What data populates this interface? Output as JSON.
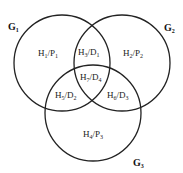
{
  "diagram": {
    "type": "venn-3",
    "stroke_color": "#222222",
    "sets": [
      {
        "id": "G1",
        "main": "G",
        "sub": "1",
        "cx": 62,
        "cy": 63,
        "r": 48,
        "label_x": 8,
        "label_y": 30
      },
      {
        "id": "G2",
        "main": "G",
        "sub": "2",
        "cx": 122,
        "cy": 63,
        "r": 48,
        "label_x": 164,
        "label_y": 31
      },
      {
        "id": "G3",
        "main": "G",
        "sub": "3",
        "cx": 93,
        "cy": 113,
        "r": 48,
        "label_x": 133,
        "label_y": 166
      }
    ],
    "regions": [
      {
        "name": "G1-only",
        "a": "H",
        "as": "1",
        "b": "P",
        "bs": "1",
        "x": 38,
        "y": 56
      },
      {
        "name": "G1-G2",
        "a": "H",
        "as": "3",
        "b": "D",
        "bs": "1",
        "x": 78,
        "y": 55
      },
      {
        "name": "G2-only",
        "a": "H",
        "as": "2",
        "b": "P",
        "bs": "2",
        "x": 123,
        "y": 56
      },
      {
        "name": "G1-G2-G3",
        "a": "H",
        "as": "7",
        "b": "D",
        "bs": "4",
        "x": 80,
        "y": 80
      },
      {
        "name": "G1-G3",
        "a": "H",
        "as": "5",
        "b": "D",
        "bs": "2",
        "x": 55,
        "y": 98
      },
      {
        "name": "G2-G3",
        "a": "H",
        "as": "6",
        "b": "D",
        "bs": "3",
        "x": 107,
        "y": 98
      },
      {
        "name": "G3-only",
        "a": "H",
        "as": "4",
        "b": "P",
        "bs": "3",
        "x": 83,
        "y": 137
      }
    ]
  }
}
